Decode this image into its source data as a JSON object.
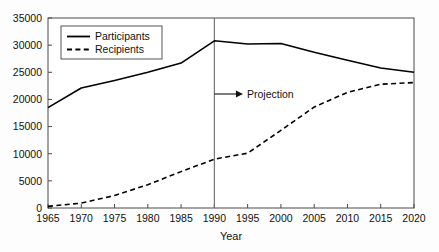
{
  "chart_data": {
    "type": "line",
    "title": "",
    "xlabel": "Year",
    "ylabel": "",
    "xlim": [
      1965,
      2020
    ],
    "ylim": [
      0,
      35000
    ],
    "grid": false,
    "legend_position": "top-left-inside",
    "x": [
      1965,
      1970,
      1975,
      1980,
      1985,
      1990,
      1995,
      2000,
      2005,
      2010,
      2015,
      2020
    ],
    "xticks": [
      "1965",
      "1970",
      "1975",
      "1980",
      "1985",
      "1990",
      "1995",
      "2000",
      "2005",
      "2010",
      "2015",
      "2020"
    ],
    "yticks": [
      "0",
      "5000",
      "10000",
      "15000",
      "20000",
      "25000",
      "30000",
      "35000"
    ],
    "ytick_values": [
      0,
      5000,
      10000,
      15000,
      20000,
      25000,
      30000,
      35000
    ],
    "series": [
      {
        "name": "Participants",
        "style": "solid",
        "color": "#000000",
        "values": [
          18500,
          22100,
          23500,
          25000,
          26700,
          30800,
          30200,
          30300,
          28700,
          27200,
          25800,
          25000
        ]
      },
      {
        "name": "Recipients",
        "style": "dashed",
        "color": "#000000",
        "values": [
          300,
          900,
          2300,
          4300,
          6700,
          9000,
          10100,
          14300,
          18600,
          21300,
          22800,
          23100
        ]
      }
    ],
    "annotations": [
      {
        "label": "Projection",
        "x": 1990,
        "y": 21000,
        "marker": "vertical-line-with-right-arrow"
      }
    ]
  },
  "legend": {
    "entries": [
      {
        "label": "Participants",
        "style": "solid"
      },
      {
        "label": "Recipients",
        "style": "dashed"
      }
    ]
  },
  "axes": {
    "x_title": "Year",
    "y_title": ""
  }
}
